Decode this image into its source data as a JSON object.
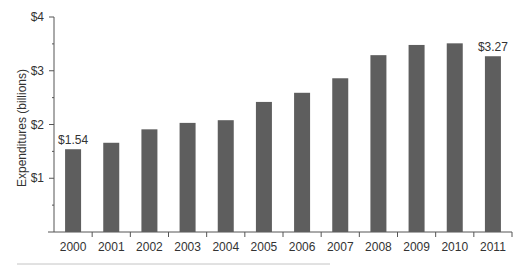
{
  "chart_data": {
    "type": "bar",
    "title": "",
    "xlabel": "",
    "ylabel": "Expenditures (billions)",
    "categories": [
      "2000",
      "2001",
      "2002",
      "2003",
      "2004",
      "2005",
      "2006",
      "2007",
      "2008",
      "2009",
      "2010",
      "2011"
    ],
    "values": [
      1.54,
      1.66,
      1.91,
      2.03,
      2.08,
      2.42,
      2.59,
      2.86,
      3.29,
      3.48,
      3.51,
      3.27
    ],
    "ylim": [
      0,
      4
    ],
    "yticks": [
      {
        "value": 1,
        "label": "$1"
      },
      {
        "value": 2,
        "label": "$2"
      },
      {
        "value": 3,
        "label": "$3"
      },
      {
        "value": 4,
        "label": "$4"
      }
    ],
    "minor_yticks": [
      0.5,
      1.5,
      2.5,
      3.5
    ],
    "annotations": [
      {
        "index": 0,
        "label": "$1.54"
      },
      {
        "index": 11,
        "label": "$3.27"
      }
    ],
    "grid": false,
    "legend": null,
    "colors": {
      "bar": "#5e5e5e",
      "axis": "#555555",
      "text": "#333333",
      "rule": "#bdbdbd"
    }
  }
}
